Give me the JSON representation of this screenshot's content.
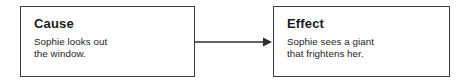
{
  "diagram": {
    "type": "cause-and-effect-flow",
    "canvas": {
      "width": 472,
      "height": 84,
      "background": "#ffffff"
    },
    "colors": {
      "border": "#3d3d3d",
      "heading_text": "#1b1b1b",
      "body_text": "#242424",
      "connector": "#2f2f2f",
      "box_fill": "#ffffff"
    },
    "nodes": [
      {
        "id": "cause",
        "heading": "Cause",
        "body_lines": [
          "Sophie looks out",
          "the window."
        ],
        "body_text": "Sophie looks out the window."
      },
      {
        "id": "effect",
        "heading": "Effect",
        "body_lines": [
          "Sophie sees a giant",
          "that frightens her."
        ],
        "body_text": "Sophie sees a giant that frightens her."
      }
    ],
    "connector": {
      "name": "arrow-right",
      "from": "cause",
      "to": "effect",
      "direction": "right",
      "style": "solid-line-with-filled-arrowhead"
    }
  }
}
